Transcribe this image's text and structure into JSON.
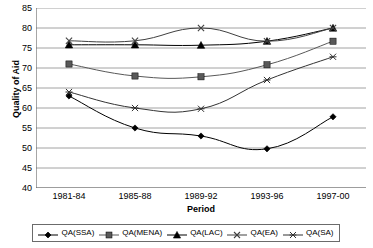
{
  "chart_data": {
    "type": "line",
    "title": "",
    "xlabel": "Period",
    "ylabel": "Quality of Aid",
    "categories": [
      "1981-84",
      "1985-88",
      "1989-92",
      "1993-96",
      "1997-00"
    ],
    "ylim": [
      40,
      85
    ],
    "yticks": [
      40,
      45,
      50,
      55,
      60,
      65,
      70,
      75,
      80,
      85
    ],
    "grid": "horizontal",
    "legend_position": "bottom",
    "series": [
      {
        "name": "QA(SSA)",
        "marker": "diamond",
        "color": "#000000",
        "values": [
          63.0,
          55.0,
          53.0,
          49.8,
          57.8
        ]
      },
      {
        "name": "QA(MENA)",
        "marker": "square",
        "color": "#595959",
        "values": [
          71.0,
          68.0,
          67.8,
          70.8,
          76.7
        ]
      },
      {
        "name": "QA(LAC)",
        "marker": "triangle",
        "color": "#000000",
        "values": [
          75.8,
          75.8,
          75.7,
          76.7,
          80.0
        ]
      },
      {
        "name": "QA(EA)",
        "marker": "x",
        "color": "#404040",
        "values": [
          76.8,
          76.8,
          80.0,
          76.7,
          80.0
        ]
      },
      {
        "name": "QA(SA)",
        "marker": "asterisk",
        "color": "#333333",
        "values": [
          64.0,
          60.0,
          59.8,
          67.0,
          72.8
        ]
      }
    ]
  },
  "axes": {
    "y_title": "Quality of Aid",
    "x_title": "Period",
    "y_tick_labels": [
      "85",
      "80",
      "75",
      "70",
      "65",
      "60",
      "55",
      "50",
      "45",
      "40"
    ],
    "x_tick_labels": [
      "1981-84",
      "1985-88",
      "1989-92",
      "1993-96",
      "1997-00"
    ]
  },
  "legend": {
    "items": [
      {
        "label": "QA(SSA)",
        "marker": "diamond-marker"
      },
      {
        "label": "QA(MENA)",
        "marker": "square-marker"
      },
      {
        "label": "QA(LAC)",
        "marker": "triangle-marker"
      },
      {
        "label": "QA(EA)",
        "marker": "x-marker"
      },
      {
        "label": "QA(SA)",
        "marker": "asterisk-marker"
      }
    ]
  },
  "colors": {
    "gridline": "#8c8c8c",
    "axis": "#6b6b6b",
    "plot_background": "#ffffff",
    "series_default": "#000000"
  }
}
